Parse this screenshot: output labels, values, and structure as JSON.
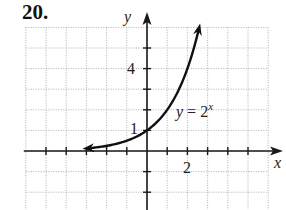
{
  "problem": {
    "number": "20."
  },
  "chart_data": {
    "type": "line",
    "title": "",
    "xlabel": "x",
    "ylabel": "y",
    "xlim": [
      -6,
      6
    ],
    "ylim": [
      -2,
      6
    ],
    "grid": true,
    "grid_style": "dotted",
    "x_tick_labels": [
      {
        "value": 2,
        "label": "2"
      }
    ],
    "y_tick_labels": [
      {
        "value": 1,
        "label": "1"
      },
      {
        "value": 4,
        "label": "4"
      }
    ],
    "series": [
      {
        "name": "y = 2^x",
        "function": "2^x",
        "x": [
          -3,
          -2,
          -1,
          0,
          1,
          2,
          2.6
        ],
        "y": [
          0.125,
          0.25,
          0.5,
          1,
          2,
          4,
          6.06
        ],
        "arrows": "both"
      }
    ],
    "annotations": [
      {
        "text": "y = 2",
        "superscript": "x",
        "x": 1.45,
        "y": 1.7
      }
    ],
    "legend": "none"
  },
  "labels": {
    "x_axis": "x",
    "y_axis": "y",
    "tick_x_2": "2",
    "tick_y_1": "1",
    "tick_y_4": "4",
    "curve_label_base": "y = 2",
    "curve_label_exp": "x"
  }
}
